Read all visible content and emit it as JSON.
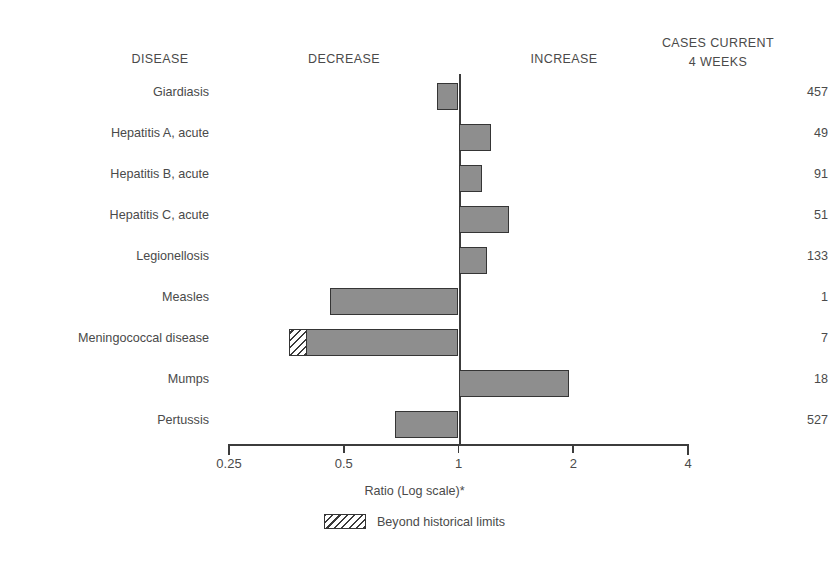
{
  "headers": {
    "disease": "DISEASE",
    "decrease": "DECREASE",
    "increase": "INCREASE",
    "cases_line1": "CASES CURRENT",
    "cases_line2": "4 WEEKS"
  },
  "axis": {
    "title": "Ratio (Log scale)*",
    "tick_labels": [
      "0.25",
      "0.5",
      "1",
      "2",
      "4"
    ]
  },
  "legend": {
    "label": "Beyond historical limits",
    "swatch": "hatched-rectangle"
  },
  "colors": {
    "bar_fill": "#8e8e8e",
    "bar_stroke": "#353535",
    "axis": "#3c3c3c",
    "text": "#4a4a4a",
    "background": "#ffffff"
  },
  "chart_data": {
    "type": "bar",
    "orientation": "horizontal",
    "title": "",
    "xlabel": "Ratio (Log scale)*",
    "ylabel": "DISEASE",
    "xscale": "log",
    "xlim": [
      0.25,
      4
    ],
    "xticks": [
      0.25,
      0.5,
      1,
      2,
      4
    ],
    "xtick_labels": [
      "0.25",
      "0.5",
      "1",
      "2",
      "4"
    ],
    "reference_line": 1,
    "grid": false,
    "legend_position": "bottom-center",
    "categories": [
      "Giardiasis",
      "Hepatitis A, acute",
      "Hepatitis B, acute",
      "Hepatitis C, acute",
      "Legionellosis",
      "Measles",
      "Meningococcal disease",
      "Mumps",
      "Pertussis"
    ],
    "values": [
      0.88,
      1.22,
      1.15,
      1.36,
      1.19,
      0.46,
      0.36,
      1.95,
      0.68
    ],
    "cases_current_4_weeks": [
      457,
      49,
      91,
      51,
      133,
      1,
      7,
      18,
      527
    ],
    "beyond_historical_limits": [
      false,
      false,
      false,
      false,
      false,
      false,
      true,
      false,
      false
    ],
    "beyond_limit_extent": [
      null,
      null,
      null,
      null,
      null,
      null,
      0.4,
      null,
      null
    ],
    "rows": [
      {
        "disease": "Giardiasis",
        "ratio": 0.88,
        "cases": "457",
        "beyond": false,
        "beyond_to": null
      },
      {
        "disease": "Hepatitis A, acute",
        "ratio": 1.22,
        "cases": "49",
        "beyond": false,
        "beyond_to": null
      },
      {
        "disease": "Hepatitis B, acute",
        "ratio": 1.15,
        "cases": "91",
        "beyond": false,
        "beyond_to": null
      },
      {
        "disease": "Hepatitis C, acute",
        "ratio": 1.36,
        "cases": "51",
        "beyond": false,
        "beyond_to": null
      },
      {
        "disease": "Legionellosis",
        "ratio": 1.19,
        "cases": "133",
        "beyond": false,
        "beyond_to": null
      },
      {
        "disease": "Measles",
        "ratio": 0.46,
        "cases": "1",
        "beyond": false,
        "beyond_to": null
      },
      {
        "disease": "Meningococcal disease",
        "ratio": 0.36,
        "cases": "7",
        "beyond": true,
        "beyond_to": 0.4
      },
      {
        "disease": "Mumps",
        "ratio": 1.95,
        "cases": "18",
        "beyond": false,
        "beyond_to": null
      },
      {
        "disease": "Pertussis",
        "ratio": 0.68,
        "cases": "527",
        "beyond": false,
        "beyond_to": null
      }
    ]
  }
}
